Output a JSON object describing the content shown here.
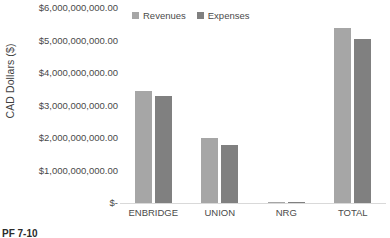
{
  "chart_data": {
    "type": "bar",
    "title": "",
    "xlabel": "",
    "ylabel": "CAD Dollars ($)",
    "categories": [
      "ENBRIDGE",
      "UNION",
      "NRG",
      "TOTAL"
    ],
    "series": [
      {
        "name": "Revenues",
        "color": "#a6a6a6",
        "values": [
          3450000000,
          2000000000,
          40000000,
          5400000000
        ]
      },
      {
        "name": "Expenses",
        "color": "#808080",
        "values": [
          3300000000,
          1780000000,
          30000000,
          5050000000
        ]
      }
    ],
    "ylim": [
      0,
      6000000000
    ],
    "ytick_values": [
      6000000000,
      5000000000,
      4000000000,
      3000000000,
      2000000000,
      1000000000,
      0
    ],
    "ytick_labels": [
      "$6,000,000,000.00",
      "$5,000,000,000.00",
      "$4,000,000,000.00",
      "$3,000,000,000.00",
      "$2,000,000,000.00",
      "$1,000,000,000.00",
      "$-"
    ],
    "grid": false,
    "legend_position": "top-left-inside"
  },
  "legend": {
    "items": [
      {
        "label": "Revenues"
      },
      {
        "label": "Expenses"
      }
    ]
  },
  "footer": {
    "caption": "PF 7-10"
  }
}
